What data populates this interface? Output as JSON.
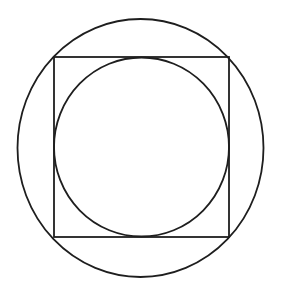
{
  "diagram": {
    "stroke_color": "#1e1e1e",
    "stroke_width": 1.8,
    "background": "#ffffff",
    "outer_circle": {
      "cx": 140.5,
      "cy": 148,
      "rx": 123,
      "ry": 129
    },
    "square": {
      "x": 54,
      "y": 57,
      "width": 175,
      "height": 180
    },
    "inner_circle": {
      "cx": 141.5,
      "cy": 147,
      "rx": 87.5,
      "ry": 89.5
    }
  }
}
